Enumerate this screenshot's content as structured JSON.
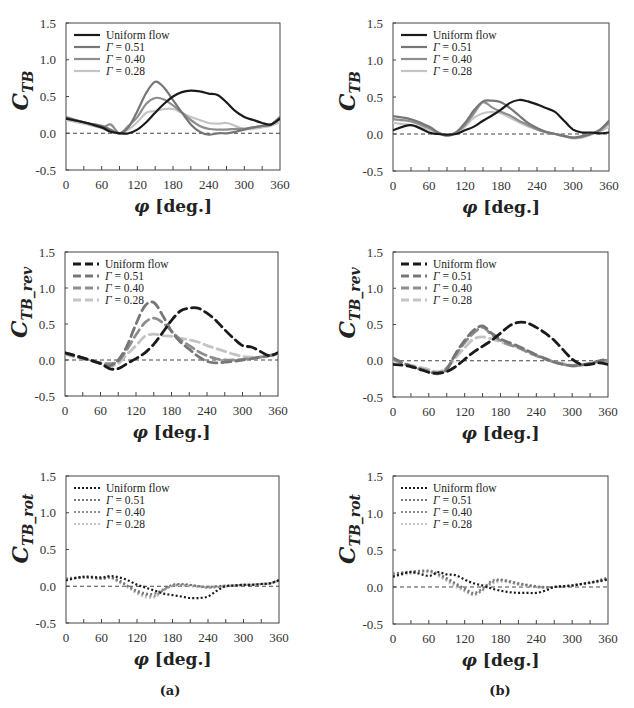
{
  "figure": {
    "labels": {
      "a": "(a)",
      "b": "(b)"
    },
    "xlabel_phi": "φ",
    "xlabel_unit": "[deg.]",
    "colors": {
      "uniform": "#1a1a1a",
      "g051": "#767676",
      "g040": "#8e8e8e",
      "g028": "#c4c4c4",
      "zero_line": "#444444"
    }
  },
  "chart_data": [
    {
      "id": "a-top",
      "type": "line",
      "column": "a",
      "ylabel": "C_TB",
      "ylabel_main": "C",
      "ylabel_sub": "TB",
      "xlabel": "φ [deg.]",
      "xlim": [
        0,
        360
      ],
      "ylim": [
        -0.5,
        1.5
      ],
      "xticks": [
        0,
        60,
        120,
        180,
        240,
        300,
        360
      ],
      "yticks": [
        "-0.5",
        "0.0",
        "0.5",
        "1.0",
        "1.5"
      ],
      "linestyle": "solid",
      "legend": [
        "Uniform flow",
        "Γ = 0.51",
        "Γ = 0.40",
        "Γ = 0.28"
      ],
      "x": [
        0,
        30,
        60,
        75,
        90,
        105,
        120,
        135,
        150,
        165,
        180,
        195,
        210,
        225,
        240,
        255,
        270,
        285,
        300,
        315,
        330,
        345,
        360
      ],
      "series": [
        {
          "name": "Uniform flow",
          "key": "uniform",
          "values": [
            0.2,
            0.15,
            0.08,
            0.02,
            0.0,
            0.0,
            0.05,
            0.15,
            0.28,
            0.4,
            0.5,
            0.56,
            0.58,
            0.57,
            0.54,
            0.52,
            0.42,
            0.3,
            0.22,
            0.18,
            0.14,
            0.12,
            0.2
          ]
        },
        {
          "name": "Γ = 0.51",
          "key": "g051",
          "values": [
            0.22,
            0.15,
            0.1,
            0.05,
            0.0,
            0.08,
            0.3,
            0.55,
            0.7,
            0.62,
            0.45,
            0.28,
            0.12,
            0.02,
            -0.02,
            0.0,
            0.0,
            0.02,
            0.05,
            0.08,
            0.1,
            0.12,
            0.22
          ]
        },
        {
          "name": "Γ = 0.40",
          "key": "g040",
          "values": [
            0.2,
            0.15,
            0.08,
            0.12,
            0.0,
            0.1,
            0.22,
            0.4,
            0.48,
            0.46,
            0.38,
            0.28,
            0.18,
            0.1,
            0.06,
            0.05,
            0.05,
            0.06,
            0.06,
            0.08,
            0.1,
            0.12,
            0.22
          ]
        },
        {
          "name": "Γ = 0.28",
          "key": "g028",
          "values": [
            0.18,
            0.13,
            0.07,
            0.02,
            0.0,
            0.05,
            0.15,
            0.28,
            0.3,
            0.33,
            0.33,
            0.28,
            0.22,
            0.18,
            0.14,
            0.13,
            0.14,
            0.1,
            0.06,
            0.06,
            0.08,
            0.1,
            0.15
          ]
        }
      ]
    },
    {
      "id": "b-top",
      "type": "line",
      "column": "b",
      "ylabel": "C_TB",
      "ylabel_main": "C",
      "ylabel_sub": "TB",
      "xlabel": "φ [deg.]",
      "xlim": [
        0,
        360
      ],
      "ylim": [
        -0.5,
        1.5
      ],
      "xticks": [
        0,
        60,
        120,
        180,
        240,
        300,
        360
      ],
      "yticks": [
        "-0.5",
        "0.0",
        "0.5",
        "1.0",
        "1.5"
      ],
      "linestyle": "solid",
      "legend": [
        "Uniform flow",
        "Γ = 0.51",
        "Γ = 0.40",
        "Γ = 0.28"
      ],
      "x": [
        0,
        30,
        60,
        75,
        90,
        105,
        120,
        135,
        150,
        165,
        180,
        195,
        210,
        225,
        240,
        255,
        270,
        285,
        300,
        315,
        330,
        345,
        360
      ],
      "series": [
        {
          "name": "Uniform flow",
          "key": "uniform",
          "values": [
            0.05,
            0.12,
            0.02,
            0.0,
            -0.01,
            0.0,
            0.05,
            0.1,
            0.18,
            0.25,
            0.33,
            0.42,
            0.46,
            0.44,
            0.4,
            0.35,
            0.3,
            0.18,
            0.06,
            0.02,
            0.02,
            0.01,
            0.02
          ]
        },
        {
          "name": "Γ = 0.51",
          "key": "g051",
          "values": [
            0.24,
            0.2,
            0.1,
            0.02,
            -0.02,
            0.02,
            0.15,
            0.32,
            0.44,
            0.45,
            0.43,
            0.35,
            0.25,
            0.15,
            0.08,
            0.03,
            0.0,
            -0.03,
            -0.05,
            -0.03,
            0.0,
            0.06,
            0.18
          ]
        },
        {
          "name": "Γ = 0.40",
          "key": "g040",
          "values": [
            0.2,
            0.17,
            0.08,
            0.02,
            -0.02,
            0.02,
            0.12,
            0.28,
            0.43,
            0.36,
            0.3,
            0.25,
            0.18,
            0.12,
            0.06,
            0.02,
            0.0,
            -0.02,
            -0.05,
            -0.04,
            0.0,
            0.05,
            0.15
          ]
        },
        {
          "name": "Γ = 0.28",
          "key": "g028",
          "values": [
            0.15,
            0.12,
            0.06,
            0.01,
            -0.03,
            0.01,
            0.1,
            0.22,
            0.28,
            0.3,
            0.28,
            0.22,
            0.16,
            0.1,
            0.06,
            0.03,
            0.0,
            -0.03,
            -0.06,
            -0.05,
            -0.01,
            0.03,
            0.1
          ]
        }
      ]
    },
    {
      "id": "a-mid",
      "type": "line",
      "column": "a",
      "ylabel": "C_TB_rev",
      "ylabel_main": "C",
      "ylabel_sub": "TB_rev",
      "xlabel": "φ [deg.]",
      "xlim": [
        0,
        360
      ],
      "ylim": [
        -0.5,
        1.5
      ],
      "xticks": [
        0,
        60,
        120,
        180,
        240,
        300,
        360
      ],
      "yticks": [
        "-0.5",
        "0.0",
        "0.5",
        "1.0",
        "1.5"
      ],
      "linestyle": "dashed",
      "legend": [
        "Uniform flow",
        "Γ = 0.51",
        "Γ = 0.40",
        "Γ = 0.28"
      ],
      "x": [
        0,
        30,
        60,
        75,
        90,
        105,
        120,
        135,
        150,
        165,
        180,
        195,
        210,
        225,
        240,
        255,
        270,
        285,
        300,
        315,
        330,
        345,
        360
      ],
      "series": [
        {
          "name": "Uniform flow",
          "key": "uniform",
          "values": [
            0.1,
            0.03,
            -0.05,
            -0.12,
            -0.12,
            -0.05,
            0.02,
            0.1,
            0.22,
            0.38,
            0.55,
            0.68,
            0.72,
            0.72,
            0.65,
            0.55,
            0.42,
            0.3,
            0.2,
            0.18,
            0.12,
            0.06,
            0.1
          ]
        },
        {
          "name": "Γ = 0.51",
          "key": "g051",
          "values": [
            0.1,
            0.03,
            -0.05,
            -0.08,
            0.0,
            0.2,
            0.5,
            0.75,
            0.8,
            0.62,
            0.4,
            0.25,
            0.15,
            0.05,
            -0.02,
            -0.04,
            -0.03,
            -0.02,
            0.0,
            0.02,
            0.04,
            0.06,
            0.1
          ]
        },
        {
          "name": "Γ = 0.40",
          "key": "g040",
          "values": [
            0.09,
            0.02,
            -0.04,
            -0.05,
            -0.02,
            0.15,
            0.35,
            0.52,
            0.58,
            0.52,
            0.4,
            0.28,
            0.2,
            0.12,
            0.06,
            0.02,
            0.0,
            0.0,
            0.01,
            0.02,
            0.04,
            0.06,
            0.09
          ]
        },
        {
          "name": "Γ = 0.28",
          "key": "g028",
          "values": [
            0.08,
            0.02,
            -0.04,
            -0.08,
            -0.05,
            0.08,
            0.2,
            0.33,
            0.36,
            0.34,
            0.33,
            0.3,
            0.28,
            0.25,
            0.2,
            0.16,
            0.12,
            0.08,
            0.05,
            0.04,
            0.04,
            0.05,
            0.08
          ]
        }
      ]
    },
    {
      "id": "b-mid",
      "type": "line",
      "column": "b",
      "ylabel": "C_TB_rev",
      "ylabel_main": "C",
      "ylabel_sub": "TB_rev",
      "xlabel": "φ [deg.]",
      "xlim": [
        0,
        360
      ],
      "ylim": [
        -0.5,
        1.5
      ],
      "xticks": [
        0,
        60,
        120,
        180,
        240,
        300,
        360
      ],
      "yticks": [
        "-0.5",
        "0.0",
        "0.5",
        "1.0",
        "1.5"
      ],
      "linestyle": "dashed",
      "legend": [
        "Uniform flow",
        "Γ = 0.51",
        "Γ = 0.40",
        "Γ = 0.28"
      ],
      "x": [
        0,
        30,
        60,
        75,
        90,
        105,
        120,
        135,
        150,
        165,
        180,
        195,
        210,
        225,
        240,
        255,
        270,
        285,
        300,
        315,
        330,
        345,
        360
      ],
      "series": [
        {
          "name": "Uniform flow",
          "key": "uniform",
          "values": [
            -0.05,
            -0.08,
            -0.16,
            -0.17,
            -0.15,
            -0.08,
            0.02,
            0.12,
            0.2,
            0.28,
            0.38,
            0.48,
            0.53,
            0.52,
            0.46,
            0.38,
            0.28,
            0.15,
            0.02,
            -0.05,
            -0.05,
            -0.03,
            -0.05
          ]
        },
        {
          "name": "Γ = 0.51",
          "key": "g051",
          "values": [
            0.04,
            -0.08,
            -0.15,
            -0.18,
            -0.12,
            0.1,
            0.28,
            0.42,
            0.48,
            0.38,
            0.3,
            0.25,
            0.2,
            0.14,
            0.08,
            0.03,
            -0.02,
            -0.05,
            -0.07,
            -0.06,
            -0.04,
            0.0,
            0.02
          ]
        },
        {
          "name": "Γ = 0.40",
          "key": "g040",
          "values": [
            0.02,
            -0.07,
            -0.14,
            -0.17,
            -0.1,
            0.08,
            0.25,
            0.38,
            0.46,
            0.36,
            0.28,
            0.22,
            0.18,
            0.12,
            0.07,
            0.02,
            -0.02,
            -0.05,
            -0.07,
            -0.06,
            -0.04,
            -0.01,
            0.01
          ]
        },
        {
          "name": "Γ = 0.28",
          "key": "g028",
          "values": [
            0.0,
            -0.06,
            -0.12,
            -0.15,
            -0.1,
            0.04,
            0.18,
            0.3,
            0.33,
            0.3,
            0.26,
            0.22,
            0.18,
            0.13,
            0.08,
            0.03,
            -0.01,
            -0.04,
            -0.06,
            -0.05,
            -0.04,
            -0.02,
            0.0
          ]
        }
      ]
    },
    {
      "id": "a-bot",
      "type": "line",
      "column": "a",
      "ylabel": "C_TB_rot",
      "ylabel_main": "C",
      "ylabel_sub": "TB_rot",
      "xlabel": "φ [deg.]",
      "xlim": [
        0,
        360
      ],
      "ylim": [
        -0.5,
        1.5
      ],
      "xticks": [
        0,
        60,
        120,
        180,
        240,
        300,
        360
      ],
      "yticks": [
        "-0.5",
        "0.0",
        "0.5",
        "1.0",
        "1.5"
      ],
      "linestyle": "dotted",
      "legend": [
        "Uniform flow",
        "Γ = 0.51",
        "Γ = 0.40",
        "Γ = 0.28"
      ],
      "x": [
        0,
        30,
        60,
        75,
        90,
        105,
        120,
        135,
        150,
        165,
        180,
        195,
        210,
        225,
        240,
        255,
        270,
        285,
        300,
        315,
        330,
        345,
        360
      ],
      "series": [
        {
          "name": "Uniform flow",
          "key": "uniform",
          "values": [
            0.08,
            0.13,
            0.12,
            0.14,
            0.12,
            0.08,
            0.02,
            -0.02,
            -0.06,
            -0.1,
            -0.12,
            -0.14,
            -0.16,
            -0.16,
            -0.14,
            -0.06,
            0.0,
            0.01,
            0.02,
            0.02,
            0.03,
            0.04,
            0.08
          ]
        },
        {
          "name": "Γ = 0.51",
          "key": "g051",
          "values": [
            0.1,
            0.12,
            0.11,
            0.12,
            0.08,
            0.0,
            -0.06,
            -0.1,
            -0.1,
            -0.04,
            0.02,
            0.03,
            0.02,
            0.0,
            -0.01,
            0.0,
            0.01,
            0.01,
            0.02,
            0.02,
            0.03,
            0.04,
            0.09
          ]
        },
        {
          "name": "Γ = 0.40",
          "key": "g040",
          "values": [
            0.11,
            0.12,
            0.1,
            0.12,
            0.06,
            0.0,
            -0.08,
            -0.12,
            -0.13,
            -0.05,
            0.01,
            0.02,
            0.01,
            0.0,
            -0.02,
            -0.01,
            0.0,
            0.01,
            0.02,
            0.02,
            0.03,
            0.04,
            0.08
          ]
        },
        {
          "name": "Γ = 0.28",
          "key": "g028",
          "values": [
            0.1,
            0.12,
            0.1,
            0.11,
            0.05,
            -0.02,
            -0.1,
            -0.15,
            -0.15,
            -0.06,
            0.0,
            0.01,
            0.0,
            -0.01,
            -0.02,
            -0.01,
            0.0,
            0.01,
            0.02,
            0.02,
            0.03,
            0.04,
            0.08
          ]
        }
      ]
    },
    {
      "id": "b-bot",
      "type": "line",
      "column": "b",
      "ylabel": "C_TB_rot",
      "ylabel_main": "C",
      "ylabel_sub": "TB_rot",
      "xlabel": "φ [deg.]",
      "xlim": [
        0,
        360
      ],
      "ylim": [
        -0.5,
        1.5
      ],
      "xticks": [
        0,
        60,
        120,
        180,
        240,
        300,
        360
      ],
      "yticks": [
        "-0.5",
        "0.0",
        "0.5",
        "1.0",
        "1.5"
      ],
      "linestyle": "dotted",
      "legend": [
        "Uniform flow",
        "Γ = 0.51",
        "Γ = 0.40",
        "Γ = 0.28"
      ],
      "x": [
        0,
        30,
        60,
        75,
        90,
        105,
        120,
        135,
        150,
        165,
        180,
        195,
        210,
        225,
        240,
        255,
        270,
        285,
        300,
        315,
        330,
        345,
        360
      ],
      "series": [
        {
          "name": "Uniform flow",
          "key": "uniform",
          "values": [
            0.14,
            0.2,
            0.15,
            0.2,
            0.17,
            0.16,
            0.1,
            0.05,
            0.02,
            -0.02,
            -0.05,
            -0.07,
            -0.08,
            -0.08,
            -0.08,
            -0.05,
            0.0,
            0.01,
            0.02,
            0.04,
            0.06,
            0.08,
            0.1
          ]
        },
        {
          "name": "Γ = 0.51",
          "key": "g051",
          "values": [
            0.18,
            0.21,
            0.22,
            0.18,
            0.12,
            0.05,
            -0.02,
            -0.08,
            -0.02,
            0.08,
            0.1,
            0.08,
            0.05,
            0.03,
            0.01,
            0.0,
            0.0,
            0.01,
            0.02,
            0.04,
            0.06,
            0.09,
            0.13
          ]
        },
        {
          "name": "Γ = 0.40",
          "key": "g040",
          "values": [
            0.16,
            0.2,
            0.21,
            0.17,
            0.1,
            0.03,
            -0.04,
            -0.1,
            -0.04,
            0.06,
            0.09,
            0.07,
            0.04,
            0.02,
            0.0,
            -0.01,
            0.0,
            0.01,
            0.02,
            0.04,
            0.06,
            0.08,
            0.12
          ]
        },
        {
          "name": "Γ = 0.28",
          "key": "g028",
          "values": [
            0.14,
            0.18,
            0.2,
            0.15,
            0.08,
            0.0,
            -0.06,
            -0.11,
            -0.05,
            0.04,
            0.07,
            0.06,
            0.03,
            0.01,
            0.0,
            -0.01,
            0.0,
            0.01,
            0.02,
            0.03,
            0.05,
            0.07,
            0.11
          ]
        }
      ]
    }
  ]
}
